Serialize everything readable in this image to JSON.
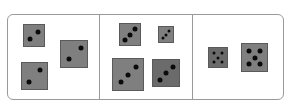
{
  "figure": {
    "panels": [
      {
        "id": "panel-1",
        "dice": [
          {
            "x": 23,
            "y": 24,
            "w": 22,
            "h": 23,
            "pips": 2,
            "shade": "normal",
            "pip_positions": [
              [
                0.68,
                0.35
              ],
              [
                0.32,
                0.65
              ]
            ]
          },
          {
            "x": 60,
            "y": 40,
            "w": 28,
            "h": 28,
            "pips": 2,
            "shade": "normal",
            "pip_positions": [
              [
                0.75,
                0.28
              ],
              [
                0.3,
                0.7
              ]
            ]
          },
          {
            "x": 21,
            "y": 62,
            "w": 27,
            "h": 28,
            "pips": 2,
            "shade": "normal",
            "pip_positions": [
              [
                0.72,
                0.28
              ],
              [
                0.28,
                0.72
              ]
            ]
          }
        ]
      },
      {
        "id": "panel-2",
        "dice": [
          {
            "x": 119,
            "y": 23,
            "w": 22,
            "h": 23,
            "pips": 3,
            "shade": "normal",
            "pip_positions": [
              [
                0.75,
                0.25
              ],
              [
                0.5,
                0.5
              ],
              [
                0.25,
                0.75
              ]
            ]
          },
          {
            "x": 158,
            "y": 26,
            "w": 16,
            "h": 17,
            "pips": 3,
            "shade": "normal",
            "small": true,
            "pip_positions": [
              [
                0.72,
                0.28
              ],
              [
                0.5,
                0.5
              ],
              [
                0.28,
                0.72
              ]
            ]
          },
          {
            "x": 112,
            "y": 58,
            "w": 32,
            "h": 33,
            "pips": 3,
            "shade": "normal",
            "pip_positions": [
              [
                0.75,
                0.27
              ],
              [
                0.5,
                0.5
              ],
              [
                0.25,
                0.75
              ]
            ]
          },
          {
            "x": 152,
            "y": 59,
            "w": 28,
            "h": 28,
            "pips": 3,
            "shade": "dark",
            "pip_positions": [
              [
                0.75,
                0.27
              ],
              [
                0.5,
                0.5
              ],
              [
                0.25,
                0.75
              ]
            ]
          }
        ]
      },
      {
        "id": "panel-3",
        "dice": [
          {
            "x": 208,
            "y": 47,
            "w": 20,
            "h": 21,
            "pips": 5,
            "shade": "dark",
            "small": true,
            "pip_positions": [
              [
                0.27,
                0.27
              ],
              [
                0.73,
                0.27
              ],
              [
                0.5,
                0.5
              ],
              [
                0.27,
                0.73
              ],
              [
                0.73,
                0.73
              ]
            ]
          },
          {
            "x": 241,
            "y": 43,
            "w": 27,
            "h": 29,
            "pips": 5,
            "shade": "normal",
            "pip_positions": [
              [
                0.27,
                0.27
              ],
              [
                0.73,
                0.27
              ],
              [
                0.5,
                0.5
              ],
              [
                0.27,
                0.73
              ],
              [
                0.73,
                0.73
              ]
            ]
          }
        ]
      }
    ],
    "dividers_x": [
      99,
      192
    ],
    "colors": {
      "border": "#9a9a9a",
      "die_fill": "#7f7f7f",
      "die_fill_dark": "#6b6b6b",
      "pip": "#0a0a0a"
    }
  }
}
